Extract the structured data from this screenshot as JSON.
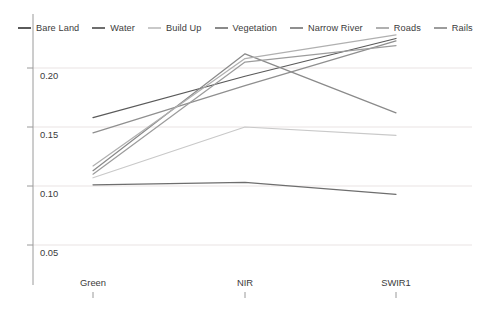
{
  "chart_data": {
    "type": "line",
    "title": "",
    "xlabel": "",
    "ylabel": "",
    "categories": [
      "Green",
      "NIR",
      "SWIR1"
    ],
    "x_tick_labels": [
      "Green",
      "NIR",
      "SWIR1"
    ],
    "y_tick_labels": [
      "0.20",
      "0.15",
      "0.10",
      "0.05"
    ],
    "y_tick_values": [
      0.2,
      0.15,
      0.1,
      0.05
    ],
    "ylim": [
      0.03,
      0.238
    ],
    "grid": "horizontal",
    "legend_position": "top-left",
    "series": [
      {
        "name": "Bare Land",
        "values": [
          0.158,
          0.193,
          0.225
        ],
        "color": "#5a5a5a"
      },
      {
        "name": "Water",
        "values": [
          0.101,
          0.103,
          0.093
        ],
        "color": "#6e6e6e"
      },
      {
        "name": "Build Up",
        "values": [
          0.107,
          0.15,
          0.143
        ],
        "color": "#c9c9c9"
      },
      {
        "name": "Vegetation",
        "values": [
          0.113,
          0.212,
          0.162
        ],
        "color": "#8a8a8a"
      },
      {
        "name": "Narrow River",
        "values": [
          0.145,
          0.185,
          0.223
        ],
        "color": "#8f8f8f"
      },
      {
        "name": "Roads",
        "values": [
          0.117,
          0.208,
          0.228
        ],
        "color": "#b0b0b0"
      },
      {
        "name": "Rails",
        "values": [
          0.11,
          0.205,
          0.219
        ],
        "color": "#9c9c9c"
      }
    ]
  },
  "legend": {
    "items": [
      {
        "label": "Bare Land"
      },
      {
        "label": "Water"
      },
      {
        "label": "Build Up"
      },
      {
        "label": "Vegetation"
      },
      {
        "label": "Narrow River"
      },
      {
        "label": "Roads"
      },
      {
        "label": "Rails"
      }
    ]
  },
  "axes": {
    "x_ticks": [
      "Green",
      "NIR",
      "SWIR1"
    ],
    "y_ticks": [
      "0.20",
      "0.15",
      "0.10",
      "0.05"
    ]
  },
  "colors": {
    "axis": "#9a9a9a",
    "grid": "#e9e3e3",
    "text": "#3b3b3b",
    "background": "#ffffff"
  }
}
